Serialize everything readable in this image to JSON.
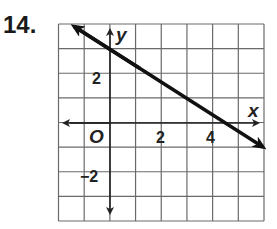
{
  "problem": {
    "number": "14."
  },
  "chart_data": {
    "type": "line",
    "title": "",
    "xlabel": "x",
    "ylabel": "y",
    "origin_label": "O",
    "xlim": [
      -2,
      6
    ],
    "ylim": [
      -4,
      4
    ],
    "grid": true,
    "x_tick_labels": [
      {
        "value": 2,
        "label": "2"
      },
      {
        "value": 4,
        "label": "4"
      }
    ],
    "y_tick_labels": [
      {
        "value": 2,
        "label": "2"
      },
      {
        "value": -2,
        "label": "−2"
      }
    ],
    "series": [
      {
        "name": "line",
        "equation": "y = -2/3 x + 3",
        "points": [
          {
            "x": -1.35,
            "y": 3.9
          },
          {
            "x": 0,
            "y": 3
          },
          {
            "x": 4.5,
            "y": 0
          },
          {
            "x": 6,
            "y": -1
          }
        ],
        "arrows": "both"
      }
    ],
    "colors": {
      "grid": "#6a6a6a",
      "line": "#111111",
      "axes": "#222222"
    }
  }
}
